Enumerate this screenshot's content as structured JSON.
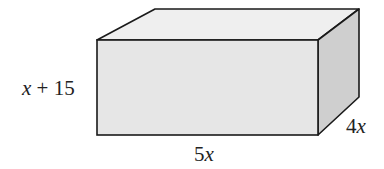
{
  "figure": {
    "shape": "rectangular-prism",
    "labels": {
      "height": {
        "var": "x",
        "rest": " + 15"
      },
      "length": {
        "coef": "5",
        "var": "x"
      },
      "depth": {
        "coef": "4",
        "var": "x"
      }
    },
    "colors": {
      "front_face": "#e6e6e6",
      "top_face": "#efefef",
      "side_face": "#cfcfcf",
      "edge": "#1a1a1a"
    }
  }
}
